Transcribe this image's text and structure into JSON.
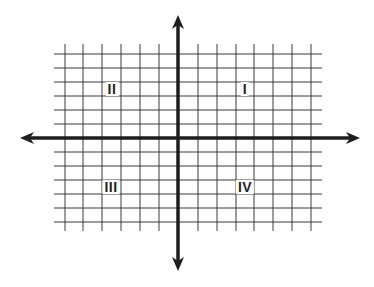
{
  "diagram": {
    "type": "cartesian-coordinate-plane",
    "title": "",
    "colors": {
      "background": "#ffffff",
      "grid": "#3a3a3a",
      "axis": "#1e1e1e",
      "label": "#222222"
    },
    "grid": {
      "x_lines": [
        65,
        83,
        102,
        121,
        140,
        159,
        198,
        217,
        236,
        254,
        273,
        292,
        311
      ],
      "y_lines": [
        54,
        68,
        82,
        96,
        110,
        124,
        152,
        166,
        180,
        194,
        208,
        222
      ],
      "x_extent": [
        54,
        322
      ],
      "y_extent": [
        44,
        231
      ]
    },
    "axes": {
      "x_axis": {
        "y": 138,
        "x_start": 20,
        "x_end": 360,
        "arrows": "both"
      },
      "y_axis": {
        "x": 178,
        "y_start": 15,
        "y_end": 271,
        "arrows": "both"
      }
    },
    "quadrants": [
      {
        "id": "quadrant-1",
        "label": "I",
        "x": 245,
        "y": 89
      },
      {
        "id": "quadrant-2",
        "label": "II",
        "x": 112,
        "y": 89
      },
      {
        "id": "quadrant-3",
        "label": "III",
        "x": 111,
        "y": 187
      },
      {
        "id": "quadrant-4",
        "label": "IV",
        "x": 245,
        "y": 187
      }
    ]
  }
}
